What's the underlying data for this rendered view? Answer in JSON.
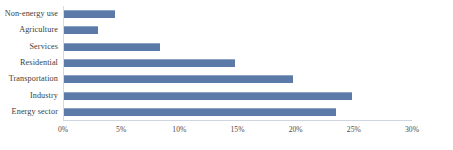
{
  "chart_data": {
    "type": "bar",
    "orientation": "horizontal",
    "title": "",
    "xlabel": "",
    "ylabel": "",
    "categories": [
      "Non-energy use",
      "Agriculture",
      "Services",
      "Residential",
      "Transportation",
      "Industry",
      "Energy sector"
    ],
    "values": [
      4.5,
      3.0,
      8.3,
      14.8,
      19.8,
      24.8,
      23.5
    ],
    "value_unit": "%",
    "xlim": [
      0,
      30
    ],
    "xticks": [
      0,
      5,
      10,
      15,
      20,
      25,
      30
    ],
    "xtick_labels": [
      "0%",
      "5%",
      "10%",
      "15%",
      "20%",
      "25%",
      "30%"
    ],
    "grid": false,
    "legend": null,
    "series": [
      {
        "name": "Share",
        "color": "#5b7aa8",
        "values": [
          4.5,
          3.0,
          8.3,
          14.8,
          19.8,
          24.8,
          23.5
        ]
      }
    ]
  },
  "colors": {
    "bar": "#5b7aa8",
    "bar_highlight": "#8ea4c4",
    "axis": "#cfd6e2",
    "text": "#3d3d3d",
    "background": "#ffffff"
  }
}
